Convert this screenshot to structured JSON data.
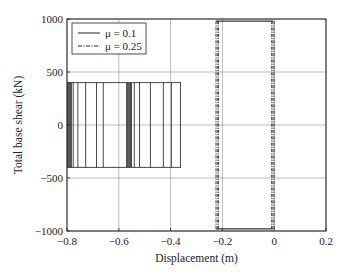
{
  "chart_data": {
    "type": "line",
    "title": "",
    "xlabel": "Displacement (m)",
    "ylabel": "Total base shear (kN)",
    "xlim": [
      -0.8,
      0.2
    ],
    "ylim": [
      -1000,
      1000
    ],
    "xticks": [
      -0.8,
      -0.6,
      -0.4,
      -0.2,
      0,
      0.2
    ],
    "xtick_labels": [
      "−0.8",
      "−0.6",
      "−0.4",
      "−0.2",
      "0",
      "0.2"
    ],
    "yticks": [
      -1000,
      -500,
      0,
      500,
      1000
    ],
    "ytick_labels": [
      "−1000",
      "−500",
      "0",
      "500",
      "1000"
    ],
    "grid": true,
    "legend_position": "upper left",
    "legend": [
      {
        "label": "μ = 0.1",
        "style": "solid"
      },
      {
        "label": "μ = 0.25",
        "style": "dashdot"
      }
    ],
    "series": [
      {
        "name": "μ = 0.1",
        "style": "solid",
        "description": "Rigid-plastic hysteresis loops between base shear ±400 kN, drifting from about -0.8 m to -0.36 m",
        "shear_limits": [
          -400,
          400
        ],
        "x_range": [
          -0.8,
          -0.36
        ],
        "vertical_branch_x": [
          -0.798,
          -0.795,
          -0.792,
          -0.789,
          -0.786,
          -0.783,
          -0.776,
          -0.758,
          -0.728,
          -0.686,
          -0.66,
          -0.57,
          -0.566,
          -0.562,
          -0.558,
          -0.555,
          -0.551,
          -0.54,
          -0.52,
          -0.478,
          -0.428,
          -0.397,
          -0.362
        ]
      },
      {
        "name": "μ = 0.25",
        "style": "dashdot",
        "description": "Rigid-plastic hysteresis loops between base shear ±980 kN, oscillating between about -0.225 m and -0.005 m",
        "shear_limits": [
          -980,
          980
        ],
        "x_range": [
          -0.225,
          -0.005
        ],
        "vertical_branch_x": [
          -0.225,
          -0.22,
          -0.215,
          -0.01,
          -0.005,
          0.0
        ]
      }
    ]
  }
}
